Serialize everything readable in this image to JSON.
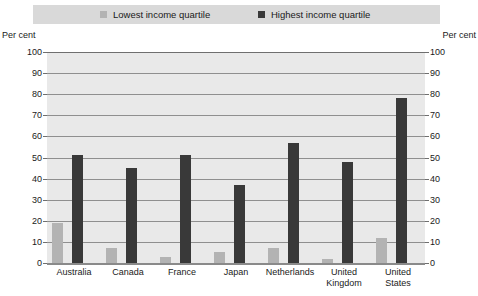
{
  "legend": {
    "entries": [
      {
        "label": "Lowest income quartile",
        "color": "#b3b3b3",
        "swatch_name": "legend-swatch-lowest"
      },
      {
        "label": "Highest income quartile",
        "color": "#393939",
        "swatch_name": "legend-swatch-highest"
      }
    ],
    "background_color": "#d9d9d9"
  },
  "axis": {
    "unit_left": "Per cent",
    "unit_right": "Per cent"
  },
  "chart_data": {
    "type": "bar",
    "title": "",
    "xlabel": "",
    "ylabel": "Per cent",
    "ylim": [
      0,
      100
    ],
    "ytick_step": 10,
    "yticks": [
      "0",
      "10",
      "20",
      "30",
      "40",
      "50",
      "60",
      "70",
      "80",
      "90",
      "100"
    ],
    "grid": true,
    "legend_position": "top",
    "categories": [
      "Australia",
      "Canada",
      "France",
      "Japan",
      "Netherlands",
      "United\nKingdom",
      "United\nStates"
    ],
    "series": [
      {
        "name": "Lowest income quartile",
        "color": "#b3b3b3",
        "values": [
          19,
          7,
          3,
          5,
          7,
          2,
          12
        ]
      },
      {
        "name": "Highest income quartile",
        "color": "#393939",
        "values": [
          51,
          45,
          51,
          37,
          57,
          48,
          78
        ]
      }
    ]
  }
}
